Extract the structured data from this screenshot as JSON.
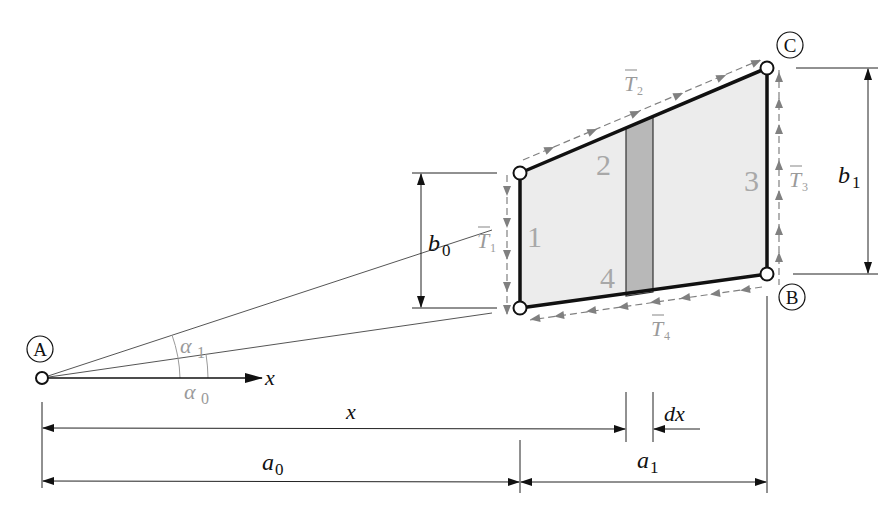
{
  "diagram": {
    "colors": {
      "panel_fill": "#ececec",
      "strip_fill": "#b8b8b8",
      "edge": "#111111",
      "shear_flow": "#808080",
      "grey_label": "#9a9a9a",
      "dim_line": "#222222"
    },
    "points": {
      "A": {
        "label": "A"
      },
      "B": {
        "label": "B"
      },
      "C": {
        "label": "C"
      }
    },
    "panel_edges": [
      {
        "number": "1"
      },
      {
        "number": "2"
      },
      {
        "number": "3"
      },
      {
        "number": "4"
      }
    ],
    "shear_flows": [
      {
        "symbol": "T",
        "sub": "1"
      },
      {
        "symbol": "T",
        "sub": "2"
      },
      {
        "symbol": "T",
        "sub": "3"
      },
      {
        "symbol": "T",
        "sub": "4"
      }
    ],
    "angles": [
      {
        "symbol": "α",
        "sub": "1"
      },
      {
        "symbol": "α",
        "sub": "0"
      }
    ],
    "axis": {
      "label": "x"
    },
    "dimensions": {
      "b0": {
        "symbol": "b",
        "sub": "0"
      },
      "b1": {
        "symbol": "b",
        "sub": "1"
      },
      "x": {
        "label": "x"
      },
      "dx": {
        "label": "dx"
      },
      "a0": {
        "symbol": "a",
        "sub": "0"
      },
      "a1": {
        "symbol": "a",
        "sub": "1"
      }
    }
  }
}
